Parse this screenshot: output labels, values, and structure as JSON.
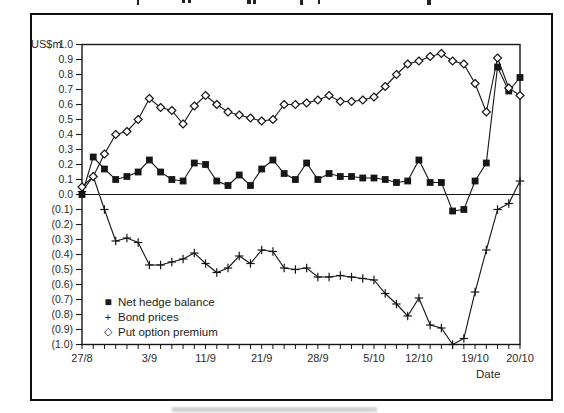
{
  "figure": {
    "y_axis_unit_label": "US$m",
    "x_axis_label": "Date",
    "legend": [
      {
        "marker": "filled-square",
        "symbol": "■",
        "label": "Net hedge balance"
      },
      {
        "marker": "plus",
        "symbol": "+",
        "label": "Bond prices"
      },
      {
        "marker": "open-diamond",
        "symbol": "◇",
        "label": "Put option premium"
      }
    ],
    "line_color": "#161616",
    "text_color": "#2a2a2a"
  },
  "chart_data": {
    "type": "line",
    "title": "",
    "xlabel": "Date",
    "ylabel": "US$m",
    "ylim": [
      -1.0,
      1.0
    ],
    "y_tick_step": 0.1,
    "y_tick_labels": [
      "1.0",
      "0.9",
      "0.8",
      "0.7",
      "0.6",
      "0.5",
      "0.4",
      "0.3",
      "0.2",
      "0.1",
      "0.0",
      "(0.1)",
      "(0.2)",
      "(0.3)",
      "(0.4)",
      "(0.5)",
      "(0.6)",
      "(0.7)",
      "(0.8)",
      "(0.9)",
      "(1.0)"
    ],
    "n_points": 40,
    "x_tick_labels": [
      {
        "label": "27/8",
        "index": 0
      },
      {
        "label": "3/9",
        "index": 6
      },
      {
        "label": "11/9",
        "index": 11
      },
      {
        "label": "21/9",
        "index": 16
      },
      {
        "label": "28/9",
        "index": 21
      },
      {
        "label": "5/10",
        "index": 26
      },
      {
        "label": "12/10",
        "index": 30
      },
      {
        "label": "19/10",
        "index": 35
      },
      {
        "label": "20/10",
        "index": 39
      }
    ],
    "zero_line": true,
    "legend_position": "lower-left-inside",
    "grid": false,
    "series": [
      {
        "name": "Net hedge balance",
        "marker": "square",
        "values": [
          0.0,
          0.25,
          0.17,
          0.1,
          0.12,
          0.15,
          0.23,
          0.15,
          0.1,
          0.09,
          0.21,
          0.2,
          0.09,
          0.06,
          0.13,
          0.06,
          0.17,
          0.23,
          0.14,
          0.1,
          0.21,
          0.1,
          0.14,
          0.12,
          0.12,
          0.11,
          0.11,
          0.1,
          0.08,
          0.09,
          0.23,
          0.08,
          0.08,
          -0.11,
          -0.1,
          0.09,
          0.21,
          0.85,
          0.69,
          0.78
        ]
      },
      {
        "name": "Bond prices",
        "marker": "plus",
        "values": [
          0.02,
          0.12,
          -0.1,
          -0.31,
          -0.29,
          -0.32,
          -0.47,
          -0.47,
          -0.45,
          -0.43,
          -0.39,
          -0.46,
          -0.52,
          -0.49,
          -0.41,
          -0.46,
          -0.37,
          -0.38,
          -0.49,
          -0.5,
          -0.49,
          -0.55,
          -0.55,
          -0.54,
          -0.55,
          -0.56,
          -0.57,
          -0.66,
          -0.73,
          -0.81,
          -0.69,
          -0.87,
          -0.89,
          -1.0,
          -0.96,
          -0.65,
          -0.37,
          -0.1,
          -0.06,
          0.09
        ]
      },
      {
        "name": "Put option premium",
        "marker": "diamond",
        "values": [
          0.05,
          0.12,
          0.27,
          0.4,
          0.42,
          0.5,
          0.64,
          0.58,
          0.56,
          0.47,
          0.59,
          0.66,
          0.6,
          0.55,
          0.53,
          0.51,
          0.49,
          0.5,
          0.6,
          0.6,
          0.61,
          0.63,
          0.66,
          0.62,
          0.62,
          0.63,
          0.65,
          0.72,
          0.8,
          0.87,
          0.89,
          0.92,
          0.94,
          0.89,
          0.87,
          0.74,
          0.55,
          0.91,
          0.71,
          0.66
        ]
      }
    ]
  },
  "cropped_edges": {
    "top_text_marks": [
      {
        "x": 137,
        "w": 2,
        "h": 5
      },
      {
        "x": 182,
        "w": 3,
        "h": 3
      },
      {
        "x": 188,
        "w": 3,
        "h": 3
      },
      {
        "x": 247,
        "w": 4,
        "h": 4
      },
      {
        "x": 253,
        "w": 3,
        "h": 4
      },
      {
        "x": 300,
        "w": 3,
        "h": 5
      },
      {
        "x": 318,
        "w": 2,
        "h": 4
      },
      {
        "x": 427,
        "w": 4,
        "h": 5
      }
    ],
    "bottom_text_band": {
      "x": 172,
      "y": 407,
      "w": 205,
      "h": 5
    }
  }
}
